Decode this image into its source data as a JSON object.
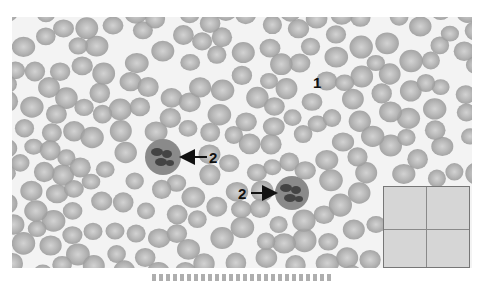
{
  "figure": {
    "background_color": "#f3f3f3",
    "rbc": {
      "count": 210,
      "seed": 7,
      "fill_color": "#9c9c9c",
      "center_color": "#cfcfcf",
      "radius_min": 9,
      "radius_max": 12
    },
    "neutrophils": [
      {
        "cx": 151,
        "cy": 140,
        "r": 18,
        "cytoplasm_color": "#8a8a8a",
        "nucleus_color": "#444444"
      },
      {
        "cx": 280,
        "cy": 176,
        "r": 17,
        "cytoplasm_color": "#8a8a8a",
        "nucleus_color": "#444444"
      }
    ]
  },
  "labels": {
    "label_1": "1",
    "label_2a": "2",
    "label_2b": "2"
  },
  "arrows": [
    {
      "name": "arrow-to-neutrophil-1",
      "x1": 207,
      "y1": 157,
      "x2": 183,
      "y2": 157
    },
    {
      "name": "arrow-to-neutrophil-2",
      "x1": 251,
      "y1": 193,
      "x2": 274,
      "y2": 193
    }
  ],
  "inset": {
    "description": "Grid inset with 4 quadrants",
    "fill_color": "#d6d6d6"
  },
  "caption": {
    "text": "",
    "note": "caption truncated at bottom edge; unreadable"
  }
}
